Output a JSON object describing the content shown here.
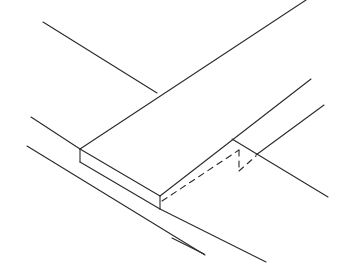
{
  "figure": {
    "width": 343,
    "height": 278,
    "stroke_color": "#2a2a2a",
    "background": "#ffffff",
    "solid_lines": [
      {
        "id": "back-left-rail-top",
        "x1": 43,
        "y1": 22,
        "x2": 157,
        "y2": 93
      },
      {
        "id": "board-back-edge",
        "x1": 306,
        "y1": 0,
        "x2": 80,
        "y2": 149
      },
      {
        "id": "left-rail-upper",
        "x1": 31,
        "y1": 117,
        "x2": 80,
        "y2": 149
      },
      {
        "id": "board-front-top-edge",
        "x1": 80,
        "y1": 149,
        "x2": 160,
        "y2": 196
      },
      {
        "id": "board-front-left-vertical",
        "x1": 80,
        "y1": 149,
        "x2": 80,
        "y2": 162
      },
      {
        "id": "board-front-bottom-edge",
        "x1": 80,
        "y1": 162,
        "x2": 160,
        "y2": 209
      },
      {
        "id": "board-front-right-vertical",
        "x1": 160,
        "y1": 196,
        "x2": 160,
        "y2": 209
      },
      {
        "id": "board-right-edge",
        "x1": 160,
        "y1": 196,
        "x2": 311,
        "y2": 79
      },
      {
        "id": "left-rail-lower",
        "x1": 27,
        "y1": 146,
        "x2": 205,
        "y2": 255
      },
      {
        "id": "front-rail-lower",
        "x1": 160,
        "y1": 209,
        "x2": 266,
        "y2": 262
      },
      {
        "id": "right-rail-near",
        "x1": 232,
        "y1": 139,
        "x2": 328,
        "y2": 197
      },
      {
        "id": "right-rail-far",
        "x1": 256,
        "y1": 155,
        "x2": 324,
        "y2": 105
      },
      {
        "id": "front-left-short",
        "x1": 172,
        "y1": 238,
        "x2": 204,
        "y2": 254
      }
    ],
    "dashed_lines": [
      {
        "id": "hidden-notch-long",
        "x1": 162,
        "y1": 201,
        "x2": 239,
        "y2": 150
      },
      {
        "id": "hidden-notch-vertical",
        "x1": 239,
        "y1": 150,
        "x2": 239,
        "y2": 171
      },
      {
        "id": "hidden-notch-short",
        "x1": 239,
        "y1": 171,
        "x2": 256,
        "y2": 156
      }
    ]
  }
}
